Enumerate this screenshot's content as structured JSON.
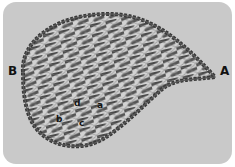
{
  "figure": {
    "background_color": "#c9c9c9",
    "thread_color": "#3a3a3a",
    "labels": {
      "point_a": "A",
      "point_b": "B",
      "cell_a": "a",
      "cell_b": "b",
      "cell_c": "c",
      "cell_d": "d"
    }
  }
}
